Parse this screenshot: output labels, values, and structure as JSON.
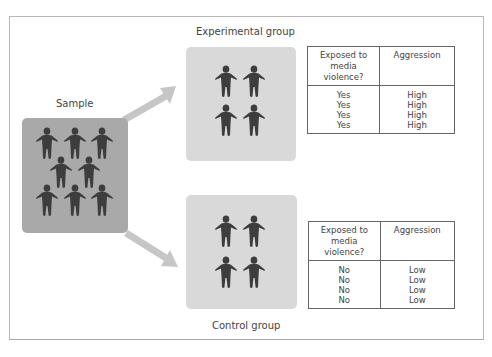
{
  "diagram": {
    "sample": {
      "label": "Sample",
      "person_count": 8,
      "icon": "person-icon",
      "fill_color": "#a9a9a9"
    },
    "experimental_group": {
      "label": "Experimental group",
      "person_count": 4,
      "icon": "person-icon",
      "fill_color": "#d9d9d9",
      "table": {
        "headers": [
          "Exposed to media violence?",
          "Aggression"
        ],
        "header_lines": [
          [
            "Exposed to",
            "media",
            "violence?"
          ],
          [
            "Aggression"
          ]
        ],
        "rows": [
          [
            "Yes",
            "High"
          ],
          [
            "Yes",
            "High"
          ],
          [
            "Yes",
            "High"
          ],
          [
            "Yes",
            "High"
          ]
        ],
        "col1": [
          "Yes",
          "Yes",
          "Yes",
          "Yes"
        ],
        "col2": [
          "High",
          "High",
          "High",
          "High"
        ]
      }
    },
    "control_group": {
      "label": "Control group",
      "person_count": 4,
      "icon": "person-icon",
      "fill_color": "#d9d9d9",
      "table": {
        "headers": [
          "Exposed to media violence?",
          "Aggression"
        ],
        "header_lines": [
          [
            "Exposed to",
            "media",
            "violence?"
          ],
          [
            "Aggression"
          ]
        ],
        "rows": [
          [
            "No",
            "Low"
          ],
          [
            "No",
            "Low"
          ],
          [
            "No",
            "Low"
          ],
          [
            "No",
            "Low"
          ]
        ],
        "col1": [
          "No",
          "No",
          "No",
          "No"
        ],
        "col2": [
          "Low",
          "Low",
          "Low",
          "Low"
        ]
      }
    },
    "arrows": [
      {
        "from": "sample",
        "to": "experimental_group",
        "color": "#c4c4c4"
      },
      {
        "from": "sample",
        "to": "control_group",
        "color": "#c4c4c4"
      }
    ],
    "colors": {
      "person": "#3d3d3d",
      "border": "#b8b8b8",
      "table_border": "#666666"
    }
  }
}
